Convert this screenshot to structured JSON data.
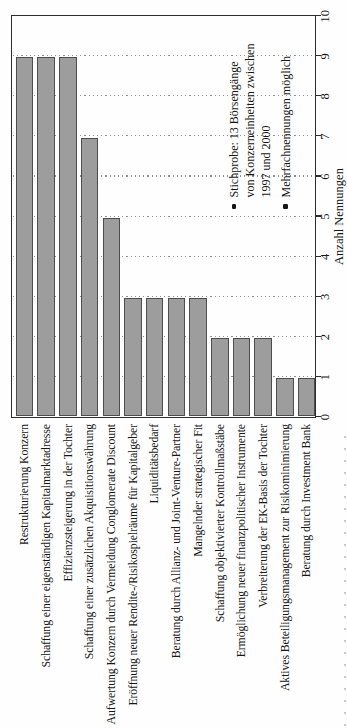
{
  "chart_data": {
    "type": "bar",
    "orientation": "horizontal bars; entire figure printed rotated 90° counter-clockwise on the page",
    "categories": [
      "Restrukturierung Konzern",
      "Schaffung einer eigenständigen Kapitalmarktadresse",
      "Effizienzsteigerung in der Tochter",
      "Schaffung einer zusätzlichen Akquisitionswährung",
      "Aufwertung Konzern durch Vermeidung Conglomerate Discount",
      "Eröffnung neuer Rendite-/Risikospielräume für Kapitalgeber",
      "Liquiditätsbedarf",
      "Beratung durch Allianz- und Joint-Venture-Partner",
      "Mangelnder strategischer Fit",
      "Schaffung objektivierter Kontrollmaßstäbe",
      "Ermöglichung neuer finanzpolitischer Instrumente",
      "Verbreiterung der EK-Basis der Tochter",
      "Aktives Beteiligungsmanagement zur Risikominimierung",
      "Beratung durch Investment Bank"
    ],
    "values": [
      9,
      9,
      9,
      7,
      5,
      3,
      3,
      3,
      3,
      2,
      2,
      2,
      1,
      1
    ],
    "xlabel": "Anzahl Nennungen",
    "xlim": [
      0,
      10
    ],
    "xticks": [
      "0",
      "1",
      "2",
      "3",
      "4",
      "5",
      "6",
      "7",
      "8",
      "9",
      "10"
    ],
    "grid": "dotted vertical gridlines at each integer value",
    "legend_position": "none",
    "bar_color": "#9d9d9d",
    "bar_border_color": "#4d4d4d",
    "notes": [
      {
        "lines": [
          "Stichprobe: 13 Börsengänge",
          "von Konzerneinheiten zwischen",
          "1997 und 2000"
        ]
      },
      {
        "lines": [
          "Mehrfachnennungen möglich"
        ]
      }
    ]
  }
}
